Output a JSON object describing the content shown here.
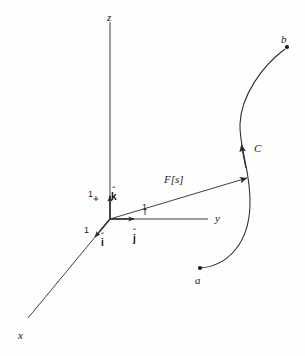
{
  "figure": {
    "background_color": "#fefefe",
    "stroke_color": "#2a2a2a",
    "text_color": "#1a1a1a"
  },
  "axes": [
    {
      "name": "z-axis",
      "label": "z",
      "label_x": 107,
      "label_y": 12
    },
    {
      "name": "y-axis",
      "label": "y",
      "label_x": 215,
      "label_y": 213
    },
    {
      "name": "x-axis",
      "label": "x",
      "label_x": 18,
      "label_y": 330
    }
  ],
  "unit_vectors": [
    {
      "name": "i-hat",
      "hat": "ˆ",
      "letter": "i",
      "tick_label": "1",
      "tick_x": 86,
      "tick_y": 228,
      "label_x": 101,
      "label_y": 232
    },
    {
      "name": "j-hat",
      "hat": "ˆ",
      "letter": "j",
      "tick_label": "1",
      "tick_x": 142,
      "tick_y": 203,
      "label_x": 133,
      "label_y": 228
    },
    {
      "name": "k-hat",
      "hat": "ˆ",
      "letter": "k",
      "tick_label": "1",
      "tick_x": 91,
      "tick_y": 190,
      "label_x": 113,
      "label_y": 186
    }
  ],
  "vectors": [
    {
      "name": "position-vector",
      "label": "F[s]",
      "label_x": 164,
      "label_y": 174
    }
  ],
  "curve": {
    "name": "curve-C",
    "label": "C",
    "label_x": 254,
    "label_y": 143,
    "start_point": {
      "label": "a",
      "label_x": 195,
      "label_y": 275,
      "dot_x": 200,
      "dot_y": 268
    },
    "end_point": {
      "label": "b",
      "label_x": 281,
      "label_y": 34,
      "dot_x": 287,
      "dot_y": 47
    }
  }
}
